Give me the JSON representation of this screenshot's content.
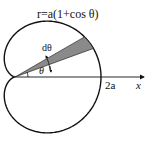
{
  "diagram": {
    "equation_label": "r=a(1+cos θ)",
    "dtheta_label": "dθ",
    "theta_label": "θ",
    "two_a_label": "2a",
    "x_axis_label": "x",
    "colors": {
      "stroke": "#111111",
      "wedge_fill": "#8a8a8a",
      "background": "#ffffff"
    }
  }
}
